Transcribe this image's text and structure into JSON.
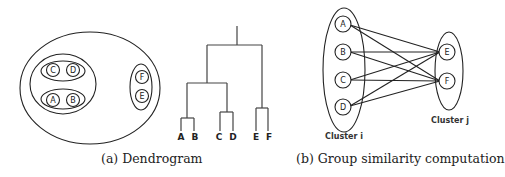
{
  "figure": {
    "panel_a": {
      "caption": "(a) Dendrogram",
      "nested_clusters": {
        "nodes": [
          "A",
          "B",
          "C",
          "D",
          "E",
          "F"
        ],
        "groups": [
          [
            "C",
            "D"
          ],
          [
            "A",
            "B"
          ],
          [
            "F",
            "E"
          ],
          [
            [
              "C",
              "D"
            ],
            [
              "A",
              "B"
            ]
          ]
        ]
      },
      "dendrogram": {
        "leaves": [
          "A",
          "B",
          "C",
          "D",
          "E",
          "F"
        ]
      }
    },
    "panel_b": {
      "caption": "(b) Group similarity computation",
      "cluster_i": {
        "label": "Cluster i",
        "nodes": [
          "A",
          "B",
          "C",
          "D"
        ]
      },
      "cluster_j": {
        "label": "Cluster j",
        "nodes": [
          "E",
          "F"
        ]
      },
      "edges": [
        [
          "A",
          "E"
        ],
        [
          "A",
          "F"
        ],
        [
          "B",
          "E"
        ],
        [
          "B",
          "F"
        ],
        [
          "C",
          "E"
        ],
        [
          "C",
          "F"
        ],
        [
          "D",
          "E"
        ],
        [
          "D",
          "F"
        ]
      ]
    },
    "colors": {
      "stroke": "#222222",
      "background": "#ffffff"
    }
  }
}
